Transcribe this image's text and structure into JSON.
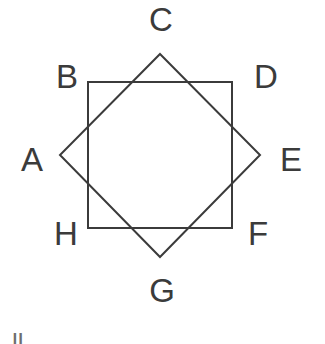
{
  "canvas": {
    "width": 325,
    "height": 344,
    "background_color": "#ffffff",
    "stroke_color": "#3b3b3b",
    "stroke_width": 2,
    "label_color": "#3b3b3b"
  },
  "figure": {
    "title": "",
    "shapes": [
      {
        "name": "axis-aligned-square",
        "type": "polygon",
        "points": [
          [
            88,
            82
          ],
          [
            232,
            82
          ],
          [
            232,
            228
          ],
          [
            88,
            228
          ]
        ],
        "fill": "none",
        "stroke": "#3b3b3b",
        "stroke_width": 2
      },
      {
        "name": "rotated-square",
        "type": "polygon",
        "points": [
          [
            160,
            54
          ],
          [
            260,
            155
          ],
          [
            160,
            257
          ],
          [
            60,
            155
          ]
        ],
        "fill": "none",
        "stroke": "#3b3b3b",
        "stroke_width": 2
      }
    ]
  },
  "labels": [
    {
      "id": "A",
      "text": "A",
      "x": 32,
      "y": 160,
      "position": "left",
      "vertex": [
        60,
        155
      ]
    },
    {
      "id": "B",
      "text": "B",
      "x": 67,
      "y": 77,
      "position": "upper-left",
      "vertex": [
        88,
        82
      ]
    },
    {
      "id": "C",
      "text": "C",
      "x": 161,
      "y": 20,
      "position": "top",
      "vertex": [
        160,
        54
      ]
    },
    {
      "id": "D",
      "text": "D",
      "x": 266,
      "y": 77,
      "position": "upper-right",
      "vertex": [
        232,
        82
      ]
    },
    {
      "id": "E",
      "text": "E",
      "x": 291,
      "y": 160,
      "position": "right",
      "vertex": [
        260,
        155
      ]
    },
    {
      "id": "F",
      "text": "F",
      "x": 258,
      "y": 234,
      "position": "lower-right",
      "vertex": [
        232,
        228
      ]
    },
    {
      "id": "G",
      "text": "G",
      "x": 162,
      "y": 291,
      "position": "bottom",
      "vertex": [
        160,
        257
      ]
    },
    {
      "id": "H",
      "text": "H",
      "x": 66,
      "y": 234,
      "position": "lower-left",
      "vertex": [
        88,
        228
      ]
    }
  ],
  "artifacts": {
    "bottom_left_partial_text": "ll"
  },
  "chart_data": {
    "type": "diagram",
    "title": "",
    "xlabel": "",
    "ylabel": "",
    "points": [
      {
        "label": "A",
        "x": 60,
        "y": 155
      },
      {
        "label": "B",
        "x": 88,
        "y": 82
      },
      {
        "label": "C",
        "x": 160,
        "y": 54
      },
      {
        "label": "D",
        "x": 232,
        "y": 82
      },
      {
        "label": "E",
        "x": 260,
        "y": 155
      },
      {
        "label": "F",
        "x": 232,
        "y": 228
      },
      {
        "label": "G",
        "x": 160,
        "y": 257
      },
      {
        "label": "H",
        "x": 88,
        "y": 228
      }
    ]
  }
}
